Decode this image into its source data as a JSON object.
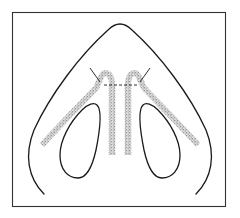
{
  "figure": {
    "type": "anatomical-line-drawing",
    "colors": {
      "line": "#1a1a1a",
      "frame": "#333333",
      "stipple": "#777777",
      "background": "#ffffff"
    },
    "elements": [
      {
        "name": "nasal-tip-outline"
      },
      {
        "name": "left-nostril"
      },
      {
        "name": "right-nostril"
      },
      {
        "name": "left-lateral-graft"
      },
      {
        "name": "right-lateral-graft"
      },
      {
        "name": "left-columellar-strut"
      },
      {
        "name": "right-columellar-strut"
      },
      {
        "name": "transection-line"
      }
    ]
  }
}
